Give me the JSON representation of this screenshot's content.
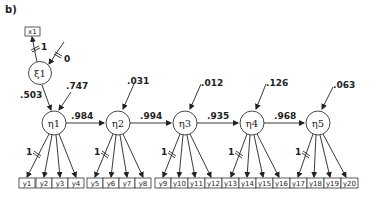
{
  "panel_label": "b)",
  "exogenous": {
    "indicator": "x1",
    "latent": "ξ1",
    "loading": "1",
    "error_variance": "0",
    "to_eta1": ".503"
  },
  "latents": [
    {
      "label": "η1",
      "disturbance": ".747"
    },
    {
      "label": "η2",
      "disturbance": ".031"
    },
    {
      "label": "η3",
      "disturbance": ".012"
    },
    {
      "label": "η4",
      "disturbance": ".126"
    },
    {
      "label": "η5",
      "disturbance": ".063"
    }
  ],
  "paths": [
    ".984",
    ".994",
    ".935",
    ".968"
  ],
  "fixed_loading": "1",
  "indicators": [
    "y1",
    "y2",
    "y3",
    "y4",
    "y5",
    "y6",
    "y7",
    "y8",
    "y9",
    "y10",
    "y11",
    "y12",
    "y13",
    "y14",
    "y15",
    "y16",
    "y17",
    "y18",
    "y19",
    "y20"
  ]
}
